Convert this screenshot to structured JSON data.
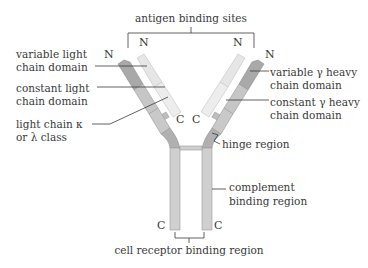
{
  "labels": {
    "antigen_binding_sites": "antigen binding sites",
    "variable_light_1": "variable light",
    "variable_light_2": "chain domain",
    "constant_light_1": "constant light",
    "constant_light_2": "chain domain",
    "light_class_1": "light chain κ",
    "light_class_2": "or λ class",
    "variable_heavy_1": "variable γ heavy",
    "variable_heavy_2": "chain domain",
    "constant_heavy_1": "constant γ heavy",
    "constant_heavy_2": "chain domain",
    "hinge": "hinge region",
    "complement_1": "complement",
    "complement_2": "binding region",
    "cell_receptor": "cell receptor binding region"
  },
  "termini": {
    "n_light_left": "N",
    "n_light_right": "N",
    "n_heavy_left": "N",
    "n_heavy_right": "N",
    "c_light_left": "C",
    "c_light_right": "C",
    "c_heavy_left": "C",
    "c_heavy_right": "C"
  },
  "colors": {
    "heavy_variable": "#a9a9a9",
    "heavy_constant": "#c9c9c9",
    "heavy_stem": "#cfcfcf",
    "light_variable": "#e4e4e4",
    "light_constant": "#ececec",
    "outline": "#9a9a9a",
    "text": "#3a3a3a"
  }
}
